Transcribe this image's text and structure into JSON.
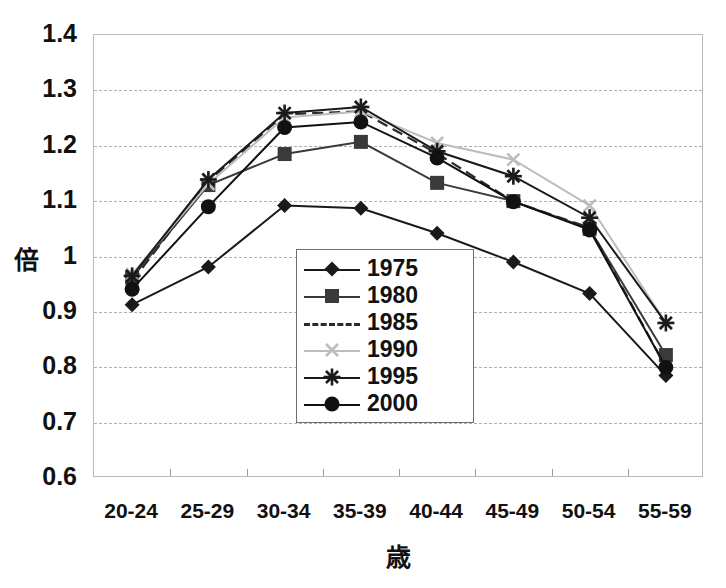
{
  "chart_data": {
    "type": "line",
    "title": "",
    "xlabel": "歳",
    "ylabel": "倍",
    "categories": [
      "20-24",
      "25-29",
      "30-34",
      "35-39",
      "40-44",
      "45-49",
      "50-54",
      "55-59"
    ],
    "ylim": [
      0.6,
      1.4
    ],
    "ytick_step": 0.1,
    "yticks": [
      "1.4",
      "1.3",
      "1.2",
      "1.1",
      "1",
      "0.9",
      "0.8",
      "0.7",
      "0.6"
    ],
    "grid": true,
    "legend_position": "inside-center-bottom",
    "series": [
      {
        "name": "1975",
        "marker": "diamond",
        "color": "#1a1a1a",
        "dashed": false,
        "values": [
          0.913,
          0.981,
          1.092,
          1.087,
          1.042,
          0.99,
          0.933,
          0.785
        ]
      },
      {
        "name": "1980",
        "marker": "square",
        "color": "#3a3a3a",
        "dashed": false,
        "values": [
          0.962,
          1.129,
          1.185,
          1.207,
          1.133,
          1.1,
          1.05,
          0.822
        ]
      },
      {
        "name": "1985",
        "marker": "none",
        "color": "#2b2b2b",
        "dashed": true,
        "values": [
          0.955,
          1.136,
          1.257,
          1.262,
          1.186,
          1.099,
          1.052,
          0.8
        ]
      },
      {
        "name": "1990",
        "marker": "cross",
        "color": "#bdbdbd",
        "dashed": false,
        "values": [
          0.968,
          1.131,
          1.251,
          1.262,
          1.205,
          1.175,
          1.092,
          0.88
        ]
      },
      {
        "name": "1995",
        "marker": "star",
        "color": "#1a1a1a",
        "dashed": false,
        "values": [
          0.965,
          1.139,
          1.259,
          1.27,
          1.19,
          1.145,
          1.07,
          0.88
        ]
      },
      {
        "name": "2000",
        "marker": "circle",
        "color": "#111111",
        "dashed": false,
        "values": [
          0.941,
          1.09,
          1.233,
          1.243,
          1.178,
          1.099,
          1.048,
          0.8
        ]
      }
    ]
  },
  "legend": {
    "entries": [
      "1975",
      "1980",
      "1985",
      "1990",
      "1995",
      "2000"
    ]
  }
}
